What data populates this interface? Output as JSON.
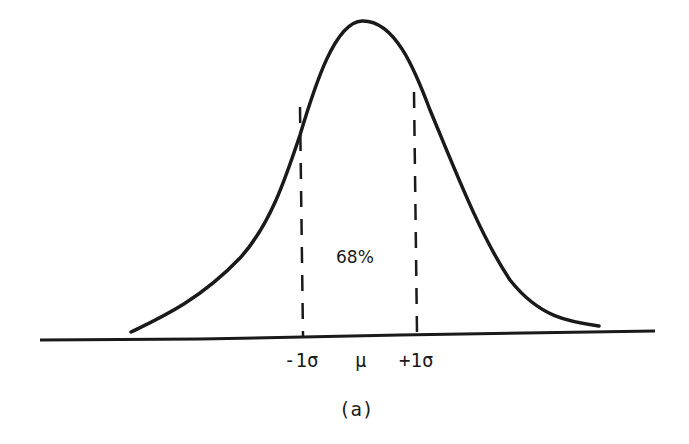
{
  "diagram": {
    "area_label": "68%",
    "axis_labels": {
      "minus_sigma": "-1σ",
      "mean": "μ",
      "plus_sigma": "+1σ"
    },
    "caption": "(a)",
    "colors": {
      "ink": "#1a1a1a",
      "background": "#ffffff"
    }
  }
}
